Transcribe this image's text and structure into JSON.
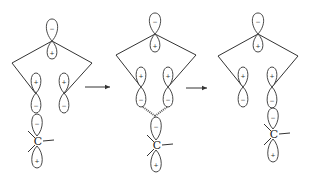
{
  "title": "",
  "stages": [
    {
      "id": "reactant",
      "description": "Diene with terminal carbon p-orbital; lone p-orbital of approaching carbon aligned with one terminal lobe",
      "ring_top_orbital": {
        "upper_sign": "−",
        "lower_sign": "+"
      },
      "left_orbital": {
        "upper_sign": "+",
        "lower_sign": "−"
      },
      "right_orbital": {
        "upper_sign": "+",
        "lower_sign": "−"
      },
      "carbon": {
        "label": "C",
        "upper_sign": "−",
        "lower_sign": "+",
        "interaction": "left"
      }
    },
    {
      "id": "transition-state",
      "description": "Carbon orbital interacting with both terminal lobes (dashed partial bonds)",
      "ring_top_orbital": {
        "upper_sign": "−",
        "lower_sign": "+"
      },
      "left_orbital": {
        "upper_sign": "+",
        "lower_sign": "−"
      },
      "right_orbital": {
        "upper_sign": "+",
        "lower_sign": "−"
      },
      "carbon": {
        "label": "C",
        "upper_sign": "−",
        "lower_sign": "+",
        "interaction": "both"
      }
    },
    {
      "id": "product",
      "description": "Carbon orbital now aligned with right terminal lobe",
      "ring_top_orbital": {
        "upper_sign": "−",
        "lower_sign": "+"
      },
      "left_orbital": {
        "upper_sign": "+",
        "lower_sign": "−"
      },
      "right_orbital": {
        "upper_sign": "+",
        "lower_sign": "−"
      },
      "carbon": {
        "label": "C",
        "upper_sign": "−",
        "lower_sign": "+",
        "interaction": "right"
      }
    }
  ],
  "arrows": [
    {
      "from": "reactant",
      "to": "transition-state"
    },
    {
      "from": "transition-state",
      "to": "product"
    }
  ]
}
